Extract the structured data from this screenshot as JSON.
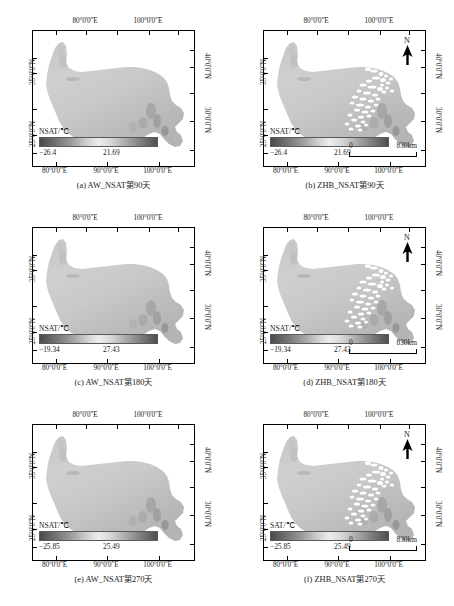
{
  "figure": {
    "region_name": "Tibetan Plateau",
    "axis": {
      "top_ticks": [
        {
          "label": "80°0'0\"E",
          "pos": 33
        },
        {
          "label": "100°0'0\"E",
          "pos": 72
        }
      ],
      "bottom_ticks": [
        {
          "label": "80°0'0\"E",
          "pos": 14
        },
        {
          "label": "90°0'0\"E",
          "pos": 46
        },
        {
          "label": "100°0'0\"E",
          "pos": 78
        }
      ],
      "left_ticks": [
        {
          "label": "35°0'0\"N",
          "pos": 31
        },
        {
          "label": "25°0'0\"N",
          "pos": 77
        }
      ],
      "right_ticks": [
        {
          "label": "40°0'0\"N",
          "pos": 27
        },
        {
          "label": "30°0'0\"N",
          "pos": 67
        }
      ]
    },
    "scalebar": {
      "zero": "0",
      "max": "830km"
    },
    "north": {
      "label": "N",
      "icon": "north-arrow-icon"
    },
    "panels": [
      {
        "id": "a",
        "caption": "(a) AW_NSAT第90天",
        "legend_title": "NSAT/℃",
        "min": "−26.4",
        "max": "21.69",
        "has_gaps": false,
        "has_scalebar": false,
        "has_north": false
      },
      {
        "id": "b",
        "caption": "(b) ZHB_NSAT第90天",
        "legend_title": "NSAT/℃",
        "min": "−26.4",
        "max": "21.69",
        "has_gaps": true,
        "has_scalebar": true,
        "has_north": true
      },
      {
        "id": "c",
        "caption": "(c) AW_NSAT第180天",
        "legend_title": "NSAT/℃",
        "min": "−19.34",
        "max": "27.43",
        "has_gaps": false,
        "has_scalebar": false,
        "has_north": false
      },
      {
        "id": "d",
        "caption": "(d) ZHB_NSAT第180天",
        "legend_title": "NSAT/℃",
        "min": "−19.34",
        "max": "27.43",
        "has_gaps": true,
        "has_scalebar": true,
        "has_north": true
      },
      {
        "id": "e",
        "caption": "(e) AW_NSAT第270天",
        "legend_title": "NSAT/℃",
        "min": "−25.85",
        "max": "25.49",
        "has_gaps": false,
        "has_scalebar": false,
        "has_north": false
      },
      {
        "id": "f",
        "caption": "(f) ZHB_NSAT第270天",
        "legend_title": "SAT/℃",
        "min": "−25.85",
        "max": "25.49",
        "has_gaps": true,
        "has_scalebar": true,
        "has_north": true
      }
    ]
  },
  "chart_data": {
    "type": "heatmap",
    "title": "",
    "xlabel": "Longitude",
    "ylabel": "Latitude",
    "grid": false,
    "legend_position": "inside-bottom-left",
    "colormap": "grayscale-diverging",
    "xlim": [
      "73°E",
      "105°E"
    ],
    "ylim": [
      "25°N",
      "41°N"
    ],
    "panel_count": 6,
    "panel_grid": [
      3,
      2
    ],
    "maps": [
      {
        "id": "a",
        "variable": "NSAT",
        "source": "AW",
        "day_of_year": 90,
        "units": "℃",
        "vmin": -26.4,
        "vmax": 21.69,
        "missing_data": false
      },
      {
        "id": "b",
        "variable": "NSAT",
        "source": "ZHB",
        "day_of_year": 90,
        "units": "℃",
        "vmin": -26.4,
        "vmax": 21.69,
        "missing_data": true
      },
      {
        "id": "c",
        "variable": "NSAT",
        "source": "AW",
        "day_of_year": 180,
        "units": "℃",
        "vmin": -19.34,
        "vmax": 27.43,
        "missing_data": false
      },
      {
        "id": "d",
        "variable": "NSAT",
        "source": "ZHB",
        "day_of_year": 180,
        "units": "℃",
        "vmin": -19.34,
        "vmax": 27.43,
        "missing_data": true
      },
      {
        "id": "e",
        "variable": "NSAT",
        "source": "AW",
        "day_of_year": 270,
        "units": "℃",
        "vmin": -25.85,
        "vmax": 25.49,
        "missing_data": false
      },
      {
        "id": "f",
        "variable": "SAT",
        "source": "ZHB",
        "day_of_year": 270,
        "units": "℃",
        "vmin": -25.85,
        "vmax": 25.49,
        "missing_data": true
      }
    ],
    "scale_bar_km": 830,
    "tick_labels": {
      "longitude": [
        "80°0'0\"E",
        "90°0'0\"E",
        "100°0'0\"E"
      ],
      "latitude_left": [
        "35°0'0\"N",
        "25°0'0\"N"
      ],
      "latitude_right": [
        "40°0'0\"N",
        "30°0'0\"N"
      ]
    }
  }
}
